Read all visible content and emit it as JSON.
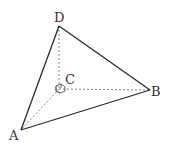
{
  "diagram": {
    "type": "tetrahedron",
    "points": {
      "A": {
        "label": "A",
        "x": 21,
        "y": 130
      },
      "B": {
        "label": "B",
        "x": 150,
        "y": 90
      },
      "C": {
        "label": "C",
        "x": 59,
        "y": 89
      },
      "D": {
        "label": "D",
        "x": 59,
        "y": 26
      }
    },
    "solid_edges": [
      "DA",
      "DB",
      "AB"
    ],
    "hidden_edges": [
      "DC",
      "CB",
      "CA"
    ],
    "right_angle_marker_at": "C"
  }
}
